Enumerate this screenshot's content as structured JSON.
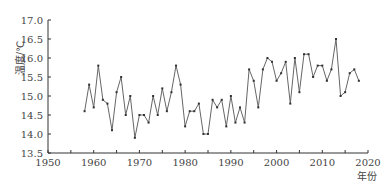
{
  "chart_data": {
    "type": "line",
    "title": "",
    "xlabel": "年份",
    "ylabel": "温度/℃",
    "xlim": [
      1950,
      2020
    ],
    "ylim": [
      13.5,
      17.0
    ],
    "x_ticks": [
      1950,
      1960,
      1970,
      1980,
      1990,
      2000,
      2010,
      2020
    ],
    "x_tick_labels": [
      "1950",
      "1960",
      "1970",
      "1980",
      "1990",
      "2000",
      "2010",
      "2020"
    ],
    "y_ticks": [
      13.5,
      14.0,
      14.5,
      15.0,
      15.5,
      16.0,
      16.5,
      17.0
    ],
    "y_tick_labels": [
      "13.5",
      "14.0",
      "14.5",
      "15.0",
      "15.5",
      "16.0",
      "16.5",
      "17.0"
    ],
    "grid": false,
    "legend": null,
    "series": [
      {
        "name": "温度",
        "color": "#555555",
        "marker": "square",
        "x": [
          1958,
          1959,
          1960,
          1961,
          1962,
          1963,
          1964,
          1965,
          1966,
          1967,
          1968,
          1969,
          1970,
          1971,
          1972,
          1973,
          1974,
          1975,
          1976,
          1977,
          1978,
          1979,
          1980,
          1981,
          1982,
          1983,
          1984,
          1985,
          1986,
          1987,
          1988,
          1989,
          1990,
          1991,
          1992,
          1993,
          1994,
          1995,
          1996,
          1997,
          1998,
          1999,
          2000,
          2001,
          2002,
          2003,
          2004,
          2005,
          2006,
          2007,
          2008,
          2009,
          2010,
          2011,
          2012,
          2013,
          2014,
          2015,
          2016,
          2017,
          2018
        ],
        "values": [
          14.6,
          15.3,
          14.7,
          15.8,
          14.9,
          14.8,
          14.1,
          15.1,
          15.5,
          14.5,
          15.0,
          13.9,
          14.5,
          14.5,
          14.3,
          15.0,
          14.5,
          15.2,
          14.6,
          15.1,
          15.8,
          15.3,
          14.2,
          14.6,
          14.6,
          14.8,
          14.0,
          14.0,
          14.9,
          14.7,
          14.9,
          14.2,
          15.0,
          14.3,
          14.7,
          14.3,
          15.7,
          15.4,
          14.7,
          15.7,
          16.0,
          15.9,
          15.4,
          15.6,
          15.9,
          14.8,
          16.0,
          15.1,
          16.1,
          16.1,
          15.5,
          15.8,
          15.8,
          15.4,
          15.7,
          16.5,
          15.0,
          15.1,
          15.6,
          15.7,
          15.4
        ]
      }
    ]
  }
}
